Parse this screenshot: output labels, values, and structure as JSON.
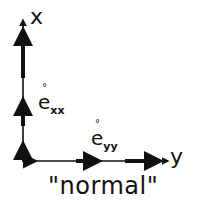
{
  "diagram": {
    "axes": {
      "vertical_label": "x",
      "horizontal_label": "y"
    },
    "strain_labels": {
      "exx": {
        "base": "e",
        "accent": "°",
        "subscript": "xx"
      },
      "eyy": {
        "base": "e",
        "accent": "°",
        "subscript": "yy"
      }
    },
    "caption": "\"normal\"",
    "colors": {
      "ink": "#111111",
      "background": "#ffffff"
    }
  }
}
